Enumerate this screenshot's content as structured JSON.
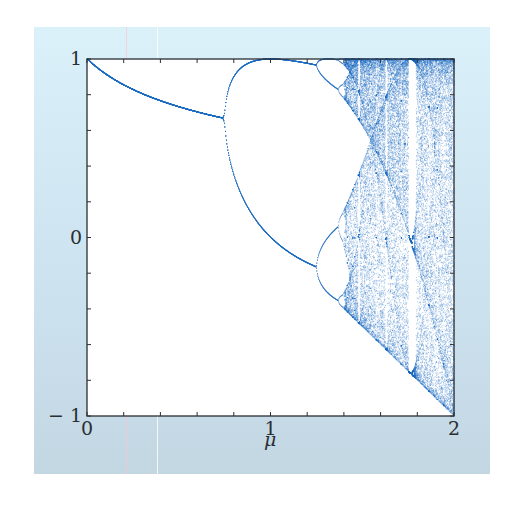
{
  "chart_data": {
    "type": "scatter",
    "title": "",
    "map": {
      "formula": "x -> 1 - mu * x^2",
      "x0": 0.1,
      "transient": 300,
      "samples": 160
    },
    "xlabel": "μ",
    "ylabel": "",
    "xlim": [
      0,
      2
    ],
    "ylim": [
      -1,
      1
    ],
    "x_ticks": [
      {
        "value": 0,
        "label": "0"
      },
      {
        "value": 1,
        "label": "1"
      },
      {
        "value": 2,
        "label": "2"
      }
    ],
    "y_ticks": [
      {
        "value": 1,
        "label": "1"
      },
      {
        "value": 0,
        "label": "0"
      },
      {
        "value": -1,
        "label": "− 1"
      }
    ],
    "minor_tick_step": 0.2,
    "grid": false,
    "legend": null,
    "features": {
      "period_doubling_1": 0.75,
      "period_doubling_2": 1.25,
      "onset_of_chaos": 1.401,
      "period_3_window": 1.75,
      "fixed_point_at_mu_0_75": 0.667
    },
    "point_color": "#1f6fc4"
  },
  "colors": {
    "panel_top": "#daf1fa",
    "panel_bottom": "#c3d7e3",
    "axis": "#2a2f33",
    "points": "#1f6fc4"
  }
}
